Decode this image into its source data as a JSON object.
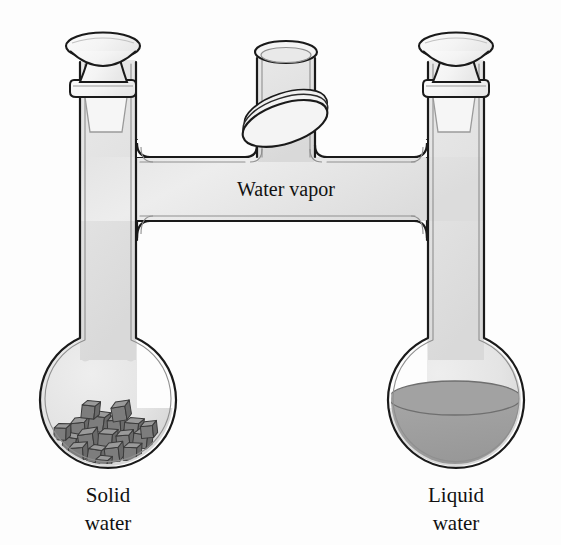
{
  "figure": {
    "background_color": "#fdfdfd"
  },
  "labels": {
    "vapor": "Water vapor",
    "left_line1": "Solid",
    "left_line2": "water",
    "right_line1": "Liquid",
    "right_line2": "water"
  },
  "colors": {
    "glass_outline": "#1a1a1a",
    "glass_inner_line": "#9a9a9a",
    "gas_fill_light": "#ececec",
    "gas_fill_dark": "#d8d8d8",
    "liquid_fill": "#9d9d9d",
    "liquid_surface": "#8a8a8a",
    "ice_top": "#9a9a9a",
    "ice_side_left": "#7d7d7d",
    "ice_side_right": "#6a6a6a",
    "ice_outline": "#3a3a3a",
    "stopper_fill": "#f2f2f2",
    "valve_fill": "#efefef",
    "text": "#111111"
  },
  "apparatus": {
    "left_flask": {
      "name": "Solid water flask",
      "center_x": 107,
      "center_y": 400,
      "radius": 68,
      "contents": "solid-ice-cubes",
      "neck_left_x": 80,
      "neck_right_x": 136,
      "neck_top_y": 150
    },
    "right_flask": {
      "name": "Liquid water flask",
      "center_x": 455,
      "center_y": 400,
      "radius": 68,
      "contents": "liquid-water",
      "neck_left_x": 428,
      "neck_right_x": 484,
      "neck_top_y": 150,
      "liquid_level_y": 398
    },
    "connecting_tube": {
      "name": "Horizontal vapor bridge",
      "top_y": 157,
      "bottom_y": 220,
      "left_x": 80,
      "right_x": 484
    },
    "center_tube": {
      "name": "Central valve stem",
      "left_x": 257,
      "right_x": 315,
      "rim_y": 50,
      "bottom_y": 157
    },
    "valve": {
      "name": "Stopcock valve disc",
      "center_x": 286,
      "center_y": 120,
      "rx": 44,
      "ry": 20,
      "rotation_deg": -18,
      "state": "open"
    },
    "left_stopper": {
      "name": "Left ground-glass stopper",
      "cap_center_x": 103,
      "cap_center_y": 45,
      "cap_rx": 37,
      "cap_ry": 13,
      "collar_y": 90
    },
    "right_stopper": {
      "name": "Right ground-glass stopper",
      "cap_center_x": 456,
      "cap_center_y": 45,
      "cap_rx": 37,
      "cap_ry": 13,
      "collar_y": 90
    }
  },
  "ice_cubes": [
    {
      "x": 78,
      "y": 430,
      "size": 14,
      "rot": -6
    },
    {
      "x": 96,
      "y": 424,
      "size": 15,
      "rot": 8
    },
    {
      "x": 114,
      "y": 427,
      "size": 13,
      "rot": -3
    },
    {
      "x": 131,
      "y": 430,
      "size": 14,
      "rot": 5
    },
    {
      "x": 69,
      "y": 444,
      "size": 13,
      "rot": 10
    },
    {
      "x": 86,
      "y": 442,
      "size": 15,
      "rot": -8
    },
    {
      "x": 105,
      "y": 441,
      "size": 14,
      "rot": 4
    },
    {
      "x": 123,
      "y": 442,
      "size": 13,
      "rot": -5
    },
    {
      "x": 140,
      "y": 441,
      "size": 14,
      "rot": 7
    },
    {
      "x": 76,
      "y": 455,
      "size": 14,
      "rot": -4
    },
    {
      "x": 94,
      "y": 456,
      "size": 13,
      "rot": 9
    },
    {
      "x": 112,
      "y": 455,
      "size": 14,
      "rot": -7
    },
    {
      "x": 130,
      "y": 454,
      "size": 13,
      "rot": 3
    },
    {
      "x": 88,
      "y": 412,
      "size": 13,
      "rot": 6
    },
    {
      "x": 119,
      "y": 414,
      "size": 14,
      "rot": -9
    },
    {
      "x": 60,
      "y": 434,
      "size": 12,
      "rot": 2
    },
    {
      "x": 147,
      "y": 432,
      "size": 12,
      "rot": -6
    },
    {
      "x": 101,
      "y": 466,
      "size": 12,
      "rot": 5
    }
  ]
}
